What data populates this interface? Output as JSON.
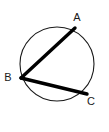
{
  "figure": {
    "background_color": "#ffffff",
    "width": 109,
    "height": 132
  },
  "circle": {
    "name": "circumscribed-circle",
    "center_x": 57,
    "center_y": 64,
    "radius": 37,
    "stroke_color": "#1a1a1a",
    "stroke_width": 1.1,
    "fill": "none"
  },
  "chords": [
    {
      "name": "chord-ab",
      "from": "B",
      "to": "A",
      "x1": 21,
      "y1": 78,
      "x2": 75,
      "y2": 28,
      "stroke_color": "#000000",
      "stroke_width": 3.4
    },
    {
      "name": "chord-bc",
      "from": "B",
      "to": "C",
      "x1": 21,
      "y1": 78,
      "x2": 87,
      "y2": 94,
      "stroke_color": "#000000",
      "stroke_width": 3.4
    }
  ],
  "vertices": [
    {
      "id": "A",
      "label": "A",
      "point_x": 75,
      "point_y": 28,
      "label_x": 77,
      "label_y": 21
    },
    {
      "id": "B",
      "label": "B",
      "point_x": 21,
      "point_y": 78,
      "label_x": 8,
      "label_y": 81
    },
    {
      "id": "C",
      "label": "C",
      "point_x": 87,
      "point_y": 94,
      "label_x": 91,
      "label_y": 105
    }
  ]
}
